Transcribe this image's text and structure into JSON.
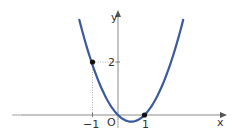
{
  "chart_data": {
    "type": "line",
    "title": "",
    "function": "y = x^2 - x",
    "xlabel": "x",
    "ylabel": "y",
    "origin_label": "O",
    "x_tick_labels": [
      "-1",
      "1"
    ],
    "y_tick_labels": [
      "2"
    ],
    "xlim": [
      -4.45,
      4.2
    ],
    "ylim": [
      -0.85,
      4.3
    ],
    "grid": false,
    "legend": null,
    "marked_points": [
      {
        "x": -1,
        "y": 2
      },
      {
        "x": 1,
        "y": 0
      }
    ],
    "series": [
      {
        "name": "parabola",
        "color": "#3a5a9c",
        "x": [
          -1.46,
          -1.0,
          -0.5,
          0,
          0.5,
          1.0,
          1.5,
          2.0,
          2.46
        ],
        "y": [
          3.59,
          2.0,
          0.75,
          0,
          -0.25,
          0,
          0.75,
          2.0,
          3.59
        ]
      }
    ]
  },
  "axes": {
    "x_label": "x",
    "y_label": "y",
    "origin": "O",
    "tick_minus_one": "−1",
    "tick_one": "1",
    "tick_two": "2"
  },
  "colors": {
    "curve": "#3a5a9c",
    "axis": "#8a8a8a",
    "point": "#111111"
  }
}
